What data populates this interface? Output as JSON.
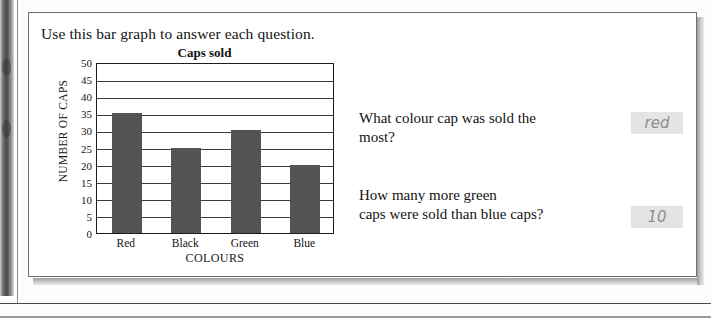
{
  "worksheet": {
    "prompt": "Use this bar graph to answer each question."
  },
  "chart_data": {
    "type": "bar",
    "title": "Caps sold",
    "xlabel": "COLOURS",
    "ylabel": "NUMBER OF CAPS",
    "categories": [
      "Red",
      "Black",
      "Green",
      "Blue"
    ],
    "values": [
      35,
      25,
      30,
      20
    ],
    "ylim": [
      0,
      50
    ],
    "ytick_labels": [
      "0",
      "5",
      "10",
      "15",
      "20",
      "25",
      "30",
      "35",
      "40",
      "45",
      "50"
    ],
    "ytick_values": [
      0,
      5,
      10,
      15,
      20,
      25,
      30,
      35,
      40,
      45,
      50
    ],
    "grid": true,
    "legend": "none",
    "bar_color": "#545454",
    "axis_color": "#1d1d1d"
  },
  "questions": [
    {
      "number": "1",
      "text": "What colour cap was sold the\nmost?",
      "answer": "red"
    },
    {
      "number": "2",
      "text": "How many more green\ncaps were sold than blue caps?",
      "answer": "10"
    }
  ],
  "colors": {
    "page_background": "#fdfdfd",
    "card_background": "#ffffff",
    "card_border": "#6e6e6e",
    "text": "#131313",
    "answer_fill": "#e4e4e4",
    "answer_text": "#8e8e8e",
    "bar": "#545454"
  }
}
